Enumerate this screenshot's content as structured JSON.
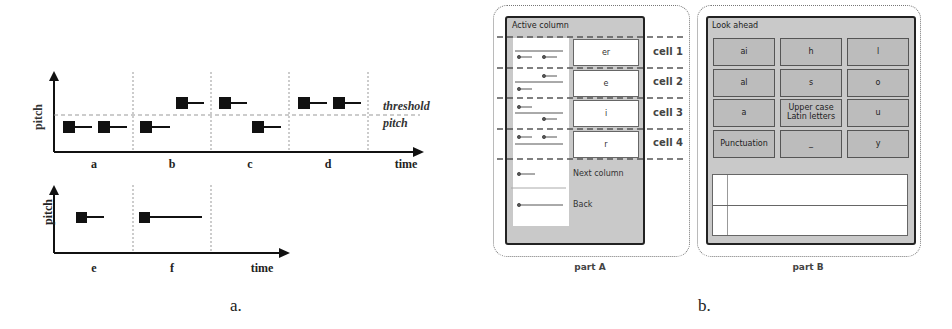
{
  "figure_a": {
    "caption": "a.",
    "top_chart": {
      "y_label": "pitch",
      "x_label": "time",
      "threshold_label_1": "threshold",
      "threshold_label_2": "pitch",
      "segments": [
        "a",
        "b",
        "c",
        "d"
      ]
    },
    "bottom_chart": {
      "y_label": "pitch",
      "x_label": "time",
      "segments": [
        "e",
        "f"
      ]
    }
  },
  "figure_b": {
    "caption": "b.",
    "part_a": {
      "label": "part A",
      "panel_title": "Active column",
      "cells": [
        {
          "value": "er",
          "label": "cell 1"
        },
        {
          "value": "e",
          "label": "cell 2"
        },
        {
          "value": "i",
          "label": "cell 3"
        },
        {
          "value": "r",
          "label": "cell 4"
        }
      ],
      "next_column_label": "Next column",
      "back_label": "Back"
    },
    "part_b": {
      "label": "part B",
      "panel_title": "Look ahead",
      "grid": [
        [
          "ai",
          "h",
          "l"
        ],
        [
          "al",
          "s",
          "o"
        ],
        [
          "a",
          "Upper case Latin letters",
          "u"
        ],
        [
          "Punctuation",
          "_",
          "y"
        ]
      ]
    }
  }
}
